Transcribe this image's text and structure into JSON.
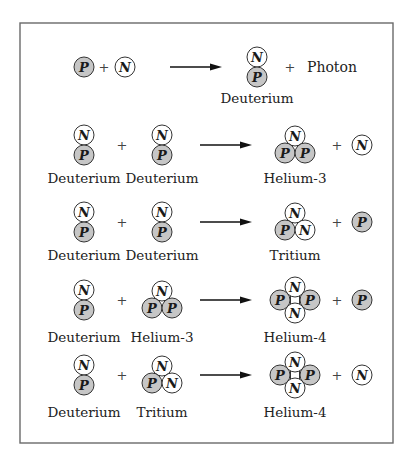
{
  "figure": {
    "particle_symbols": {
      "proton": "P",
      "neutron": "N"
    },
    "colors": {
      "proton_fill": "#c6c6c6",
      "neutron_fill": "#ffffff",
      "outline": "#333333"
    },
    "plus_sign": "+",
    "reactions": [
      {
        "reactants": [
          {
            "type": "proton",
            "label": ""
          },
          {
            "type": "neutron",
            "label": ""
          }
        ],
        "product": {
          "type": "deuterium",
          "label": "Deuterium"
        },
        "byproduct": {
          "type": "text",
          "text": "Photon"
        }
      },
      {
        "reactants": [
          {
            "type": "deuterium",
            "label": "Deuterium"
          },
          {
            "type": "deuterium",
            "label": "Deuterium"
          }
        ],
        "product": {
          "type": "helium3",
          "label": "Helium-3"
        },
        "byproduct": {
          "type": "neutron"
        }
      },
      {
        "reactants": [
          {
            "type": "deuterium",
            "label": "Deuterium"
          },
          {
            "type": "deuterium",
            "label": "Deuterium"
          }
        ],
        "product": {
          "type": "tritium",
          "label": "Tritium"
        },
        "byproduct": {
          "type": "proton"
        }
      },
      {
        "reactants": [
          {
            "type": "deuterium",
            "label": "Deuterium"
          },
          {
            "type": "helium3",
            "label": "Helium-3"
          }
        ],
        "product": {
          "type": "helium4",
          "label": "Helium-4"
        },
        "byproduct": {
          "type": "proton"
        }
      },
      {
        "reactants": [
          {
            "type": "deuterium",
            "label": "Deuterium"
          },
          {
            "type": "tritium",
            "label": "Tritium"
          }
        ],
        "product": {
          "type": "helium4",
          "label": "Helium-4"
        },
        "byproduct": {
          "type": "neutron"
        }
      }
    ]
  }
}
